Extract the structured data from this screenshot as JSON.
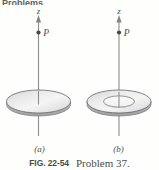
{
  "page": {
    "running_header": "Problems"
  },
  "figure": {
    "caption_figure_number": "FIG. 22-54",
    "caption_text": "Problem 37.",
    "panels": [
      {
        "id": "a",
        "sublabel": "(a)",
        "axis_label": "z",
        "point_label": "P",
        "shape": "uniformly-charged-disk",
        "description": "Solid shaded disk drawn in perspective as an ellipse, pierced at its center by the vertical z axis; point P lies on the axis above the disk."
      },
      {
        "id": "b",
        "sublabel": "(b)",
        "axis_label": "z",
        "point_label": "P",
        "shape": "annulus-ring",
        "description": "Flat annulus (ring) drawn in perspective as two concentric ellipses with the central hole unshaded; the vertical z axis passes through the hole and point P lies on the axis above the ring."
      }
    ],
    "colors": {
      "ink": "#231f20",
      "axis_line": "#6f6f71",
      "outline": "#58585b",
      "surface_light": "#f2f2f2",
      "surface_mid": "#d8d8da",
      "surface_dark": "#b9b9bc",
      "background": "#ffffff"
    }
  }
}
